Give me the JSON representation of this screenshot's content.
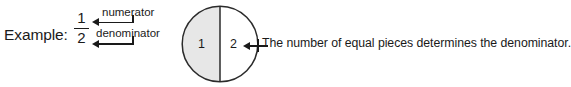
{
  "figure": {
    "example_label": "Example:",
    "fraction": {
      "numerator": "1",
      "denominator": "2"
    },
    "callouts": {
      "numerator_label": "numerator",
      "denominator_label": "denominator"
    },
    "circle": {
      "piece_labels": [
        "1",
        "2"
      ],
      "shaded_fill": "#e7e7e7",
      "unshaded_fill": "#ffffff",
      "stroke": "#2b2b2b"
    },
    "annotation": "The number of equal pieces determines the denominator.",
    "ink_color": "#1a1a1a"
  }
}
